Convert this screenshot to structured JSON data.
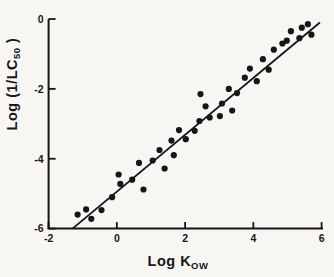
{
  "figure": {
    "paper_color": "#f7f6f3",
    "ink_color": "#161616"
  },
  "chart_data": {
    "type": "scatter",
    "title": "",
    "xlabel_main": "Log K",
    "xlabel_sub": "OW",
    "ylabel_main": "Log (1/LC",
    "ylabel_sub": "50",
    "ylabel_end": " )",
    "xlim": [
      -2,
      6
    ],
    "ylim": [
      -6,
      0
    ],
    "grid": false,
    "legend": null,
    "x_ticks": [
      {
        "value": -2,
        "label": "-2"
      },
      {
        "value": 0,
        "label": "0"
      },
      {
        "value": 2,
        "label": "2"
      },
      {
        "value": 4,
        "label": "4"
      },
      {
        "value": 6,
        "label": "6"
      }
    ],
    "y_ticks": [
      {
        "value": 0,
        "label": "0"
      },
      {
        "value": -2,
        "label": "-2"
      },
      {
        "value": -4,
        "label": "-4"
      },
      {
        "value": -6,
        "label": "-6"
      }
    ],
    "fit_line": {
      "x1": -1.3,
      "y1": -6.0,
      "x2": 5.95,
      "y2": -0.1,
      "slope": 0.81,
      "intercept": -4.94
    },
    "points": [
      [
        -1.15,
        -5.6
      ],
      [
        -0.9,
        -5.45
      ],
      [
        -0.75,
        -5.72
      ],
      [
        -0.45,
        -5.47
      ],
      [
        -0.14,
        -5.1
      ],
      [
        0.05,
        -4.45
      ],
      [
        0.1,
        -4.72
      ],
      [
        0.45,
        -4.6
      ],
      [
        0.65,
        -4.12
      ],
      [
        0.78,
        -4.88
      ],
      [
        1.05,
        -4.05
      ],
      [
        1.25,
        -3.75
      ],
      [
        1.4,
        -4.28
      ],
      [
        1.6,
        -3.48
      ],
      [
        1.67,
        -3.9
      ],
      [
        1.82,
        -3.18
      ],
      [
        2.02,
        -3.44
      ],
      [
        2.28,
        -3.2
      ],
      [
        2.42,
        -2.92
      ],
      [
        2.45,
        -2.15
      ],
      [
        2.6,
        -2.5
      ],
      [
        2.72,
        -2.82
      ],
      [
        3.02,
        -2.78
      ],
      [
        3.08,
        -2.42
      ],
      [
        3.28,
        -2.0
      ],
      [
        3.38,
        -2.62
      ],
      [
        3.52,
        -2.12
      ],
      [
        3.75,
        -1.68
      ],
      [
        3.9,
        -1.42
      ],
      [
        4.1,
        -1.78
      ],
      [
        4.28,
        -1.15
      ],
      [
        4.45,
        -1.45
      ],
      [
        4.6,
        -0.88
      ],
      [
        4.85,
        -0.7
      ],
      [
        4.98,
        -0.62
      ],
      [
        5.1,
        -0.35
      ],
      [
        5.35,
        -0.55
      ],
      [
        5.42,
        -0.25
      ],
      [
        5.6,
        -0.15
      ],
      [
        5.7,
        -0.45
      ]
    ]
  }
}
